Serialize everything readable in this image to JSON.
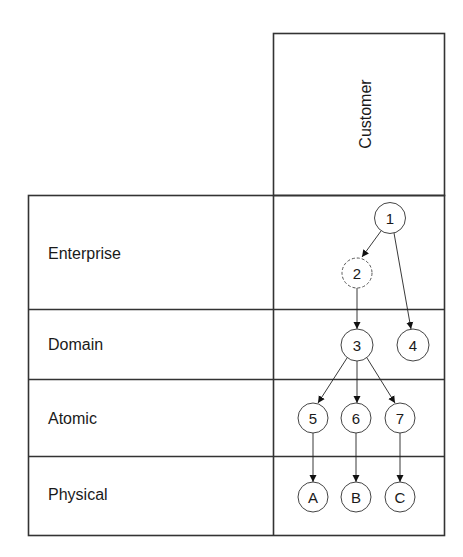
{
  "column_header": {
    "label": "Customer"
  },
  "rows": [
    {
      "label": "Enterprise"
    },
    {
      "label": "Domain"
    },
    {
      "label": "Atomic"
    },
    {
      "label": "Physical"
    }
  ],
  "nodes": {
    "n1": {
      "label": "1",
      "style": "solid"
    },
    "n2": {
      "label": "2",
      "style": "dashed"
    },
    "n3": {
      "label": "3",
      "style": "solid"
    },
    "n4": {
      "label": "4",
      "style": "solid"
    },
    "n5": {
      "label": "5",
      "style": "solid"
    },
    "n6": {
      "label": "6",
      "style": "solid"
    },
    "n7": {
      "label": "7",
      "style": "solid"
    },
    "nA": {
      "label": "A",
      "style": "solid"
    },
    "nB": {
      "label": "B",
      "style": "solid"
    },
    "nC": {
      "label": "C",
      "style": "solid"
    }
  },
  "edges": [
    {
      "from": "1",
      "to": "2"
    },
    {
      "from": "1",
      "to": "4"
    },
    {
      "from": "2",
      "to": "3"
    },
    {
      "from": "3",
      "to": "5"
    },
    {
      "from": "3",
      "to": "6"
    },
    {
      "from": "3",
      "to": "7"
    },
    {
      "from": "5",
      "to": "A"
    },
    {
      "from": "6",
      "to": "B"
    },
    {
      "from": "7",
      "to": "C"
    }
  ]
}
